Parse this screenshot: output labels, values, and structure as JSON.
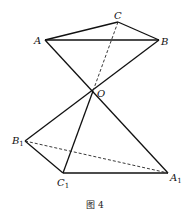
{
  "figure": {
    "caption": "图 4",
    "points": {
      "A": {
        "label": "A",
        "sub": "",
        "x": 45,
        "y": 40
      },
      "B": {
        "label": "B",
        "sub": "",
        "x": 159,
        "y": 40
      },
      "C": {
        "label": "C",
        "sub": "",
        "x": 118,
        "y": 22
      },
      "O": {
        "label": "O",
        "sub": "",
        "x": 93,
        "y": 91
      },
      "A1": {
        "label": "A",
        "sub": "1",
        "x": 168,
        "y": 173
      },
      "B1": {
        "label": "B",
        "sub": "1",
        "x": 25,
        "y": 141
      },
      "C1": {
        "label": "C",
        "sub": "1",
        "x": 63,
        "y": 173
      }
    },
    "segments_solid": [
      [
        "A",
        "C"
      ],
      [
        "C",
        "B"
      ],
      [
        "A",
        "B"
      ],
      [
        "A",
        "A1"
      ],
      [
        "B",
        "B1"
      ],
      [
        "O",
        "C1"
      ],
      [
        "B1",
        "C1"
      ],
      [
        "C1",
        "A1"
      ]
    ],
    "segments_dashed": [
      [
        "C",
        "O"
      ],
      [
        "B1",
        "A1"
      ]
    ]
  }
}
